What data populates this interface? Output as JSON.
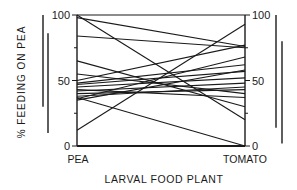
{
  "chart_data": {
    "type": "line",
    "title": "",
    "xlabel": "LARVAL FOOD PLANT",
    "ylabel": "% FEEDING ON PEA",
    "categories": [
      "PEA",
      "TOMATO"
    ],
    "ylim": [
      0,
      100
    ],
    "left_ticks": [
      "0",
      "50",
      "100"
    ],
    "right_ticks": [
      "0",
      "50",
      "100"
    ],
    "grid": false,
    "legend": null,
    "series": [
      {
        "name": "line-1",
        "values": [
          100,
          100
        ]
      },
      {
        "name": "line-2",
        "values": [
          100,
          20
        ]
      },
      {
        "name": "line-3",
        "values": [
          98,
          76
        ]
      },
      {
        "name": "line-4",
        "values": [
          84,
          75
        ]
      },
      {
        "name": "line-5",
        "values": [
          65,
          30
        ]
      },
      {
        "name": "line-6",
        "values": [
          55,
          40
        ]
      },
      {
        "name": "line-7",
        "values": [
          50,
          77
        ]
      },
      {
        "name": "line-8",
        "values": [
          48,
          62
        ]
      },
      {
        "name": "line-9",
        "values": [
          47,
          57
        ]
      },
      {
        "name": "line-10",
        "values": [
          45,
          52
        ]
      },
      {
        "name": "line-11",
        "values": [
          43,
          37
        ]
      },
      {
        "name": "line-12",
        "values": [
          42,
          48
        ]
      },
      {
        "name": "line-13",
        "values": [
          40,
          43
        ]
      },
      {
        "name": "line-14",
        "values": [
          38,
          45
        ]
      },
      {
        "name": "line-15",
        "values": [
          37,
          0
        ]
      },
      {
        "name": "line-16",
        "values": [
          36,
          68
        ]
      },
      {
        "name": "line-17",
        "values": [
          35,
          58
        ]
      },
      {
        "name": "line-18",
        "values": [
          12,
          93
        ]
      }
    ],
    "side_bars": {
      "left": [
        {
          "top": 100,
          "bottom": 30
        },
        {
          "top": 86,
          "bottom": 10
        }
      ],
      "right": [
        {
          "top": 100,
          "bottom": 14
        },
        {
          "top": 80,
          "bottom": 2
        }
      ]
    }
  },
  "labels": {
    "ylabel": "% FEEDING ON PEA",
    "xlabel": "LARVAL FOOD PLANT",
    "x_left": "PEA",
    "x_right": "TOMATO",
    "left_tick_100": "100",
    "left_tick_50": "50",
    "left_tick_0": "0",
    "right_tick_100": "100",
    "right_tick_50": "50",
    "right_tick_0": "0"
  },
  "colors": {
    "ink": "#1a1a1a",
    "background": "#ffffff"
  }
}
